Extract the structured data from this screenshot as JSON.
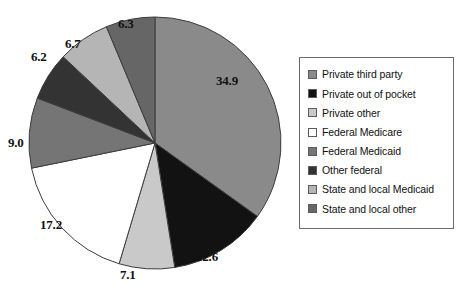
{
  "chart_data": {
    "type": "pie",
    "title": "",
    "xlabel": "",
    "ylabel": "",
    "legend_position": "right",
    "grid": false,
    "start_angle_deg": 0,
    "direction": "clockwise",
    "units": "percent",
    "categories": [
      "Private third party",
      "Private out of pocket",
      "Private other",
      "Federal Medicare",
      "Federal Medicaid",
      "Other federal",
      "State and local Medicaid",
      "State and local other"
    ],
    "values": [
      34.9,
      12.6,
      7.1,
      17.2,
      9.0,
      6.2,
      6.7,
      6.3
    ],
    "labels": [
      "34.9",
      "12.6",
      "7.1",
      "17.2",
      "9.0",
      "6.2",
      "6.7",
      "6.3"
    ],
    "colors": [
      "#8a8a8a",
      "#121212",
      "#c9c9c9",
      "#ffffff",
      "#757575",
      "#333333",
      "#b5b5b5",
      "#666666"
    ],
    "slice_border_color": "#3d3d3d",
    "total": 100.0
  },
  "legend": {
    "items": [
      {
        "label": "Private third party",
        "color": "#8a8a8a"
      },
      {
        "label": "Private out of pocket",
        "color": "#121212"
      },
      {
        "label": "Private other",
        "color": "#c9c9c9"
      },
      {
        "label": "Federal Medicare",
        "color": "#ffffff"
      },
      {
        "label": "Federal Medicaid",
        "color": "#757575"
      },
      {
        "label": "Other federal",
        "color": "#333333"
      },
      {
        "label": "State and local Medicaid",
        "color": "#b5b5b5"
      },
      {
        "label": "State and local other",
        "color": "#666666"
      }
    ]
  },
  "data_labels": [
    {
      "text": "34.9",
      "left": 216,
      "top": 74
    },
    {
      "text": "12.6",
      "top": 250,
      "left": 196
    },
    {
      "text": "7.1",
      "top": 268,
      "left": 120
    },
    {
      "text": "17.2",
      "top": 218,
      "left": 40
    },
    {
      "text": "9.0",
      "top": 136,
      "left": 8
    },
    {
      "text": "6.2",
      "top": 50,
      "left": 31
    },
    {
      "text": "6.7",
      "top": 37,
      "left": 65
    },
    {
      "text": "6.3",
      "top": 17,
      "left": 118
    }
  ]
}
